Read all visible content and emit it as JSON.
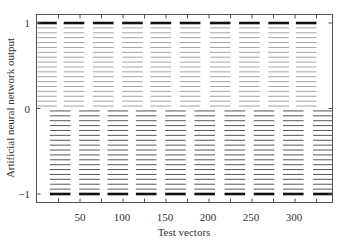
{
  "chart_data": {
    "type": "scatter",
    "title": "",
    "xlabel": "Test vectors",
    "ylabel": "Artificial neural network output",
    "xlim": [
      0,
      343
    ],
    "ylim": [
      -1.1,
      1.1
    ],
    "x_ticks": [
      50,
      100,
      150,
      200,
      250,
      300
    ],
    "x_minor_ticks": [
      25,
      75,
      125,
      175,
      225,
      275,
      325
    ],
    "y_ticks": [
      -1,
      0,
      1
    ],
    "grid": false,
    "legend": null,
    "series": [
      {
        "name": "positive-class outputs",
        "color": "#9a9a9a",
        "bold_value": 1,
        "x_block_centers": [
          11,
          43,
          77,
          111,
          144,
          178,
          213,
          247,
          281,
          313
        ],
        "block_width": 24,
        "y_range": [
          0.0,
          1.0
        ]
      },
      {
        "name": "negative-class outputs",
        "color": "#444444",
        "bold_value": -1,
        "x_block_centers": [
          27,
          61,
          94,
          127,
          161,
          195,
          230,
          264,
          298,
          333
        ],
        "block_width": 24,
        "y_range": [
          -1.0,
          0.0
        ]
      }
    ]
  },
  "axes": {
    "x_tick_labels": [
      "50",
      "100",
      "150",
      "200",
      "250",
      "300"
    ],
    "y_tick_labels": [
      "1",
      "0",
      "−1"
    ],
    "xlabel": "Test vectors",
    "ylabel": "Artificial neural network output"
  }
}
